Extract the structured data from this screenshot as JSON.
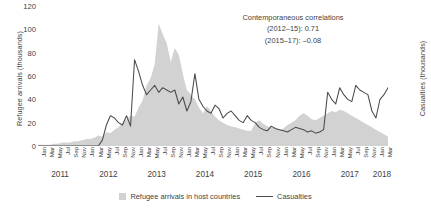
{
  "chart_data": {
    "type": "area",
    "title": "",
    "xlabel": "",
    "ylabel": "Refugee arrivals (thousands)",
    "ylabel_right": "Casualties (thousands)",
    "ylim": [
      0,
      120
    ],
    "yticks": [
      0,
      20,
      40,
      60,
      80,
      100,
      120
    ],
    "grid": false,
    "legend_position": "bottom-center",
    "x_start": "2011-01",
    "x_end": "2018-04",
    "month_tick_labels": [
      "Jan",
      "Mar",
      "May",
      "Jul",
      "Sep",
      "Nov"
    ],
    "years": [
      "2011",
      "2012",
      "2013",
      "2014",
      "2015",
      "2016",
      "2017",
      "2018"
    ],
    "annotations": [
      "Contemporaneous correlations",
      "(2012–15): 0.71",
      "(2015–17): –0.08"
    ],
    "series": [
      {
        "name": "Refugee arrivals in host countries",
        "type": "area",
        "color": "#d2d2d2",
        "values": [
          1,
          1,
          1,
          1,
          2,
          2,
          3,
          3,
          3,
          4,
          4,
          5,
          6,
          6,
          7,
          9,
          8,
          12,
          11,
          14,
          16,
          20,
          23,
          26,
          25,
          33,
          39,
          52,
          58,
          70,
          105,
          96,
          88,
          72,
          84,
          78,
          62,
          48,
          44,
          40,
          33,
          28,
          34,
          30,
          25,
          22,
          20,
          18,
          17,
          16,
          15,
          14,
          13,
          13,
          20,
          22,
          19,
          17,
          16,
          15,
          14,
          15,
          18,
          20,
          22,
          26,
          28,
          26,
          23,
          22,
          24,
          26,
          28,
          30,
          29,
          31,
          30,
          28,
          26,
          24,
          22,
          20,
          18,
          16,
          14,
          12,
          10,
          8
        ]
      },
      {
        "name": "Casualties",
        "type": "line",
        "color": "#4a4a4a",
        "values": [
          0,
          0,
          0,
          0,
          0,
          0,
          0,
          0,
          0,
          0,
          0,
          0,
          0,
          0,
          0,
          0,
          5,
          18,
          26,
          24,
          20,
          18,
          26,
          17,
          74,
          64,
          52,
          44,
          48,
          52,
          46,
          50,
          48,
          46,
          48,
          36,
          42,
          30,
          38,
          62,
          40,
          34,
          30,
          28,
          35,
          32,
          24,
          28,
          30,
          26,
          22,
          20,
          26,
          22,
          20,
          16,
          14,
          13,
          17,
          15,
          14,
          13,
          12,
          14,
          16,
          15,
          14,
          12,
          13,
          11,
          12,
          14,
          46,
          40,
          36,
          50,
          44,
          40,
          38,
          52,
          48,
          46,
          44,
          30,
          24,
          40,
          44,
          50
        ]
      }
    ]
  },
  "axes": {
    "left_title": "Refugee arrivals (thousands)",
    "right_title": "Casualties (thousands)"
  },
  "legend": {
    "items": [
      {
        "label": "Refugee arrivals in host countries",
        "marker": "area-swatch"
      },
      {
        "label": "Casualties",
        "marker": "line-swatch"
      }
    ]
  }
}
